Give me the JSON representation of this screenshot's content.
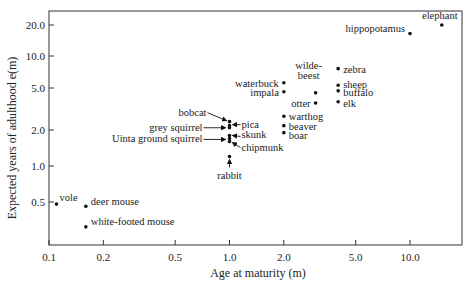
{
  "chart_data": {
    "type": "scatter",
    "title": "",
    "xlabel": "Age at maturity (m)",
    "ylabel": "Expected years of adulthood e(m)",
    "xscale": "log",
    "yscale": "log",
    "xlim": [
      0.1,
      20
    ],
    "ylim": [
      0.22,
      26
    ],
    "grid": false,
    "legend": "none",
    "x_ticks": [
      "0.1",
      "0.2",
      "0.5",
      "1.0",
      "2.0",
      "5.0",
      "10.0"
    ],
    "y_ticks": [
      "20.0",
      "10.0",
      "5.0",
      "2.0",
      "1.0",
      "0.5"
    ],
    "points": [
      {
        "label": "vole",
        "x": 0.11,
        "y": 0.48
      },
      {
        "label": "deer mouse",
        "x": 0.16,
        "y": 0.46
      },
      {
        "label": "white-footed mouse",
        "x": 0.16,
        "y": 0.31
      },
      {
        "label": "bobcat",
        "x": 1.0,
        "y": 2.4
      },
      {
        "label": "pica",
        "x": 1.0,
        "y": 2.2
      },
      {
        "label": "grey squirrel",
        "x": 1.0,
        "y": 2.1
      },
      {
        "label": "skunk",
        "x": 1.0,
        "y": 1.8
      },
      {
        "label": "Uinta ground squirrel",
        "x": 1.0,
        "y": 1.7
      },
      {
        "label": "chipmunk",
        "x": 1.0,
        "y": 1.6
      },
      {
        "label": "rabbit",
        "x": 1.0,
        "y": 1.2
      },
      {
        "label": "warthog",
        "x": 2.0,
        "y": 2.7
      },
      {
        "label": "beaver",
        "x": 2.0,
        "y": 2.2
      },
      {
        "label": "boar",
        "x": 2.0,
        "y": 1.9
      },
      {
        "label": "waterbuck",
        "x": 2.0,
        "y": 5.6
      },
      {
        "label": "impala",
        "x": 2.0,
        "y": 4.6
      },
      {
        "label": "wildebeest",
        "x": 3.0,
        "y": 4.5
      },
      {
        "label": "otter",
        "x": 3.0,
        "y": 3.6
      },
      {
        "label": "zebra",
        "x": 4.0,
        "y": 7.6
      },
      {
        "label": "sheep",
        "x": 4.0,
        "y": 5.3
      },
      {
        "label": "buffalo",
        "x": 4.0,
        "y": 4.7
      },
      {
        "label": "elk",
        "x": 4.0,
        "y": 3.7
      },
      {
        "label": "hippopotamus",
        "x": 10.0,
        "y": 16.5
      },
      {
        "label": "elephant",
        "x": 15.0,
        "y": 20.0
      }
    ]
  }
}
